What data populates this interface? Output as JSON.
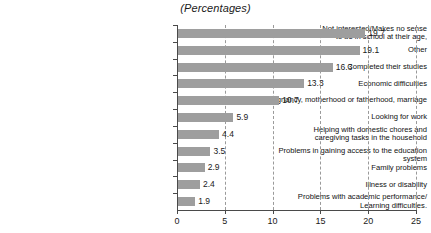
{
  "chart_data": {
    "type": "bar",
    "orientation": "horizontal",
    "title": "(Percentages)",
    "xlabel": "",
    "ylabel": "",
    "xlim": [
      0,
      25
    ],
    "xticks": [
      0,
      5,
      10,
      15,
      20,
      25
    ],
    "grid": "vertical-dashed",
    "legend": "none",
    "bar_color": "#9e9e9e",
    "categories": [
      "Not interested/Makes no sense\nto be in school at their age,",
      "Other",
      "Completed their studies",
      "Economic difficulties",
      "Pregnancy, motherhood or fatherhood, marriage",
      "Looking for work",
      "Helping with domestic chores and\ncaregiving tasks in the household",
      "Problems in gaining access to the education system",
      "Family problems",
      "Illness or disability",
      "Problems with academic performance/\nLearning difficulties."
    ],
    "values": [
      19.7,
      19.1,
      16.3,
      13.3,
      10.7,
      5.9,
      4.4,
      3.5,
      2.9,
      2.4,
      1.9
    ],
    "value_labels": [
      "19.7",
      "19.1",
      "16.3",
      "13.3",
      "10.7",
      "5.9",
      "4.4",
      "3.5",
      "2.9",
      "2.4",
      "1.9"
    ]
  }
}
